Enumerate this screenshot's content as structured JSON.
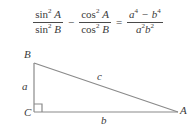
{
  "equation": {
    "left_term_1": {
      "numerator": {
        "fn": "sin",
        "exponent": "2",
        "arg": "A"
      },
      "denominator": {
        "fn": "sin",
        "exponent": "2",
        "arg": "B"
      }
    },
    "operator_1": "−",
    "left_term_2": {
      "numerator": {
        "fn": "cos",
        "exponent": "2",
        "arg": "A"
      },
      "denominator": {
        "fn": "cos",
        "exponent": "2",
        "arg": "B"
      }
    },
    "operator_2": "=",
    "right_term": {
      "numerator_var_1": "a",
      "numerator_exp_1": "4",
      "numerator_operator": "−",
      "numerator_var_2": "b",
      "numerator_exp_2": "4",
      "denominator_var_1": "a",
      "denominator_exp_1": "2",
      "denominator_var_2": "b",
      "denominator_exp_2": "2"
    },
    "plain_text": "sin^2 A / sin^2 B  −  cos^2 A / cos^2 B  =  (a^4 − b^4) / (a^2 b^2)"
  },
  "figure": {
    "type": "right-triangle",
    "vertices": [
      {
        "name": "B",
        "label": "B",
        "position": "top-left"
      },
      {
        "name": "C",
        "label": "C",
        "position": "bottom-left",
        "right_angle": true
      },
      {
        "name": "A",
        "label": "A",
        "position": "bottom-right"
      }
    ],
    "sides": [
      {
        "label": "a",
        "between": "B-C",
        "description": "vertical leg"
      },
      {
        "label": "b",
        "between": "C-A",
        "description": "horizontal leg"
      },
      {
        "label": "c",
        "between": "B-A",
        "description": "hypotenuse"
      }
    ],
    "colors": {
      "line": "#8a8a8a",
      "text": "#3b3b3b",
      "background": "#ffffff"
    }
  }
}
